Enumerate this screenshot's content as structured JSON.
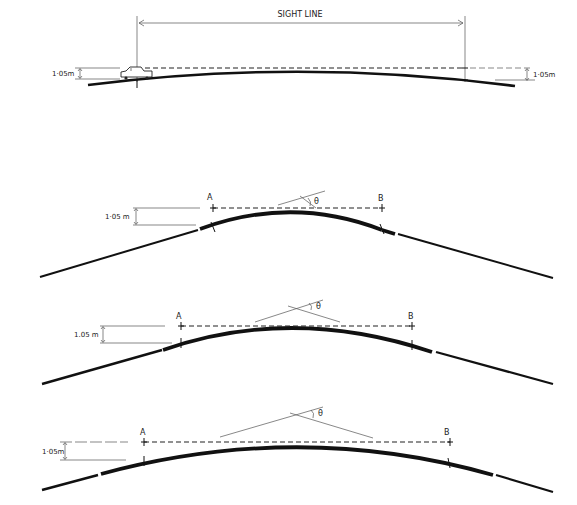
{
  "diagram": {
    "type": "sight-distance-crest-curves",
    "top_panel": {
      "sight_line_label": "SIGHT LINE",
      "left_height_label": "1·05m",
      "right_height_label": "1·05m",
      "vehicle": "car-icon"
    },
    "panels": [
      {
        "id": "sharp-crest",
        "height_label": "1·05 m",
        "point_a": "A",
        "point_b": "B",
        "angle_label": "θ"
      },
      {
        "id": "medium-crest",
        "height_label": "1.05 m",
        "point_a": "A",
        "point_b": "B",
        "angle_label": "θ"
      },
      {
        "id": "flat-crest",
        "height_label": "1·05m",
        "point_a": "A",
        "point_b": "B",
        "angle_label": "θ"
      }
    ]
  }
}
